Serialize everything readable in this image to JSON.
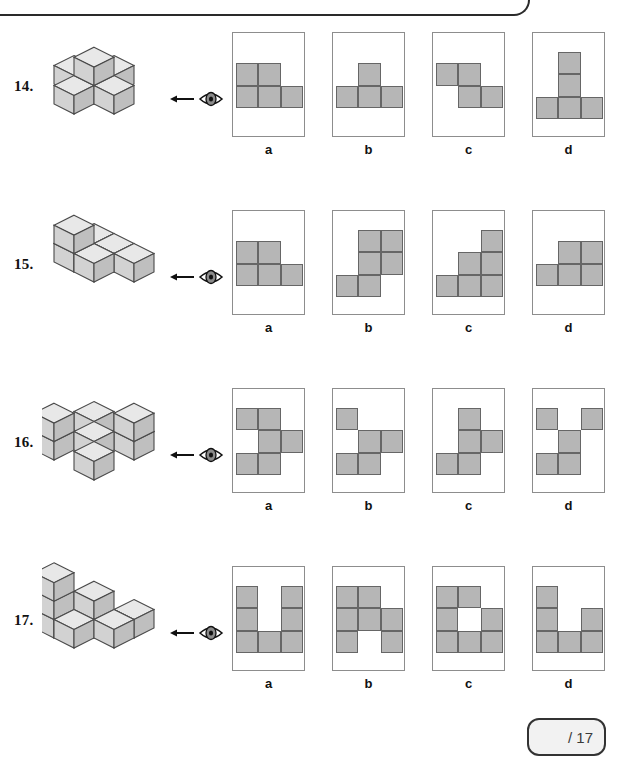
{
  "page": {
    "score_box": {
      "text": "/ 17"
    },
    "frame": "rounded-page-border"
  },
  "cube_view_icon": "eye-icon",
  "cube_view_arrow": "left-arrow-icon",
  "questions": [
    {
      "number": "14.",
      "figure": "isometric-cube-stack-plus-shape",
      "options": [
        {
          "label": "a",
          "cells": [
            [
              0,
              0
            ],
            [
              0,
              1
            ],
            [
              1,
              0
            ],
            [
              1,
              1
            ],
            [
              1,
              2
            ]
          ]
        },
        {
          "label": "b",
          "cells": [
            [
              0,
              1
            ],
            [
              1,
              0
            ],
            [
              1,
              1
            ],
            [
              1,
              2
            ]
          ]
        },
        {
          "label": "c",
          "cells": [
            [
              0,
              0
            ],
            [
              0,
              1
            ],
            [
              1,
              1
            ],
            [
              1,
              2
            ]
          ]
        },
        {
          "label": "d",
          "cells": [
            [
              0,
              1
            ],
            [
              1,
              1
            ],
            [
              2,
              0
            ],
            [
              2,
              1
            ],
            [
              2,
              2
            ]
          ]
        }
      ]
    },
    {
      "number": "15.",
      "figure": "isometric-cube-stack-staircase",
      "options": [
        {
          "label": "a",
          "cells": [
            [
              0,
              0
            ],
            [
              0,
              1
            ],
            [
              1,
              0
            ],
            [
              1,
              1
            ],
            [
              1,
              2
            ]
          ]
        },
        {
          "label": "b",
          "cells": [
            [
              0,
              1
            ],
            [
              0,
              2
            ],
            [
              1,
              1
            ],
            [
              1,
              2
            ],
            [
              2,
              0
            ],
            [
              2,
              1
            ]
          ]
        },
        {
          "label": "c",
          "cells": [
            [
              0,
              2
            ],
            [
              1,
              1
            ],
            [
              1,
              2
            ],
            [
              2,
              0
            ],
            [
              2,
              1
            ],
            [
              2,
              2
            ]
          ]
        },
        {
          "label": "d",
          "cells": [
            [
              0,
              1
            ],
            [
              0,
              2
            ],
            [
              1,
              0
            ],
            [
              1,
              1
            ],
            [
              1,
              2
            ]
          ]
        }
      ]
    },
    {
      "number": "16.",
      "figure": "isometric-cube-stack-four-corner",
      "options": [
        {
          "label": "a",
          "cells": [
            [
              0,
              0
            ],
            [
              0,
              1
            ],
            [
              1,
              1
            ],
            [
              1,
              2
            ],
            [
              2,
              0
            ],
            [
              2,
              1
            ]
          ]
        },
        {
          "label": "b",
          "cells": [
            [
              0,
              0
            ],
            [
              1,
              1
            ],
            [
              1,
              2
            ],
            [
              2,
              0
            ],
            [
              2,
              1
            ]
          ]
        },
        {
          "label": "c",
          "cells": [
            [
              0,
              1
            ],
            [
              1,
              1
            ],
            [
              1,
              2
            ],
            [
              2,
              0
            ],
            [
              2,
              1
            ]
          ]
        },
        {
          "label": "d",
          "cells": [
            [
              0,
              0
            ],
            [
              0,
              2
            ],
            [
              1,
              1
            ],
            [
              2,
              0
            ],
            [
              2,
              1
            ]
          ]
        }
      ]
    },
    {
      "number": "17.",
      "figure": "isometric-cube-stack-tall-u",
      "options": [
        {
          "label": "a",
          "cells": [
            [
              0,
              0
            ],
            [
              0,
              2
            ],
            [
              1,
              0
            ],
            [
              1,
              2
            ],
            [
              2,
              0
            ],
            [
              2,
              1
            ],
            [
              2,
              2
            ]
          ]
        },
        {
          "label": "b",
          "cells": [
            [
              0,
              0
            ],
            [
              0,
              1
            ],
            [
              1,
              0
            ],
            [
              1,
              1
            ],
            [
              1,
              2
            ],
            [
              2,
              0
            ],
            [
              2,
              2
            ]
          ]
        },
        {
          "label": "c",
          "cells": [
            [
              0,
              0
            ],
            [
              0,
              1
            ],
            [
              1,
              0
            ],
            [
              1,
              2
            ],
            [
              2,
              0
            ],
            [
              2,
              1
            ],
            [
              2,
              2
            ]
          ]
        },
        {
          "label": "d",
          "cells": [
            [
              0,
              0
            ],
            [
              1,
              0
            ],
            [
              1,
              2
            ],
            [
              2,
              0
            ],
            [
              2,
              1
            ],
            [
              2,
              2
            ]
          ]
        }
      ]
    }
  ],
  "colors": {
    "cell_fill": "#b6b6b6",
    "cell_stroke": "#666666",
    "box_stroke": "#8d8d8d",
    "cube_top": "#e8e8e8",
    "cube_left": "#d2d2d2",
    "cube_right": "#bfbfbf",
    "cube_stroke": "#4a4a4a"
  }
}
